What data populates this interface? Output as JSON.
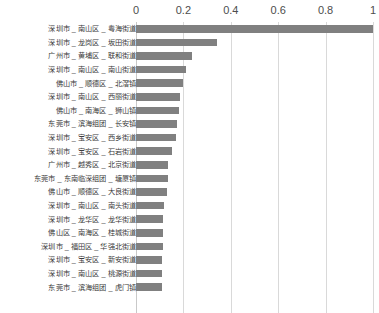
{
  "chart_data": {
    "type": "bar",
    "orientation": "horizontal",
    "title": "",
    "subtitle": "",
    "xlabel": "",
    "ylabel": "",
    "xlim": [
      0,
      1
    ],
    "grid": true,
    "legend": false,
    "axis_position": "top",
    "bar_color": "#808080",
    "gridline_color": "#d9d9d9",
    "tick_labels": [
      "0",
      "0.2",
      "0.4",
      "0.6",
      "0.8",
      "1"
    ],
    "ticks": [
      0,
      0.2,
      0.4,
      0.6,
      0.8,
      1
    ],
    "categories": [
      "深圳市 _ 南山区 _ 粤海街道",
      "深圳市 _ 龙岗区 _ 坂田街道",
      "广州市 _ 黄埔区 _ 联和街道",
      "深圳市 _ 南山区 _ 南山街道",
      "佛山市 _ 顺德区 _ 北滘镇",
      "深圳市 _ 南山区 _ 西丽街道",
      "佛山市 _ 南海区 _ 狮山镇",
      "东莞市 _ 滨海组团 _ 长安镇",
      "深圳市 _ 宝安区 _ 西乡街道",
      "深圳市 _ 宝安区 _ 石岩街道",
      "广州市 _ 越秀区 _ 北京街道",
      "东莞市 _ 东南临深组团 _ 塘厦镇",
      "佛山市 _ 顺德区 _ 大良街道",
      "深圳市 _ 南山区 _ 南头街道",
      "深圳市 _ 龙华区 _ 龙华街道",
      "佛山区 _ 南海区 _ 桂城街道",
      "深圳市 _ 福田区 _ 华强北街道",
      "深圳市 _ 宝安区 _ 新安街道",
      "深圳市 _ 南山区 _ 桃源街道",
      "东莞市 _ 滨海组团 _ 虎门镇"
    ],
    "values": [
      1.0,
      0.34,
      0.235,
      0.21,
      0.2,
      0.185,
      0.18,
      0.175,
      0.17,
      0.15,
      0.135,
      0.135,
      0.13,
      0.12,
      0.115,
      0.115,
      0.115,
      0.11,
      0.11,
      0.11
    ]
  }
}
